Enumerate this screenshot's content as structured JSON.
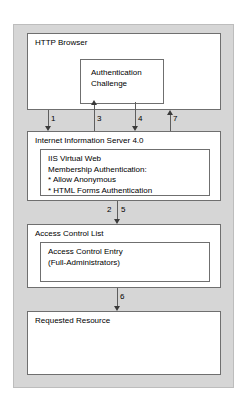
{
  "diagram": {
    "background_color": "#ffffff",
    "frame_color": "#d6d6d6",
    "box_border_color": "#6f6f6f",
    "arrow_color": "#3a3a3a"
  },
  "nodes": {
    "browser": {
      "label": "HTTP Browser",
      "inner": {
        "label": "Authentication\nChallenge"
      }
    },
    "iis": {
      "label": "Internet Information Server 4.0",
      "inner": {
        "label": "IIS Virtual Web\nMembership Authentication:\n* Allow Anonymous\n* HTML Forms Authentication"
      }
    },
    "acl": {
      "label": "Access Control List",
      "inner": {
        "label": "Access Control Entry\n(Full-Administrators)"
      }
    },
    "resource": {
      "label": "Requested Resource"
    }
  },
  "arrows": [
    {
      "id": "arrow-1",
      "label": "1",
      "direction": "down",
      "from": "browser",
      "to": "iis"
    },
    {
      "id": "arrow-3",
      "label": "3",
      "direction": "up",
      "from": "iis",
      "to": "auth-challenge"
    },
    {
      "id": "arrow-4",
      "label": "4",
      "direction": "down",
      "from": "auth-challenge",
      "to": "iis"
    },
    {
      "id": "arrow-7",
      "label": "7",
      "direction": "up",
      "from": "iis",
      "to": "browser"
    },
    {
      "id": "arrow-2-5",
      "label": "2",
      "label_secondary": "5",
      "direction": "down",
      "from": "iis",
      "to": "acl"
    },
    {
      "id": "arrow-6",
      "label": "6",
      "direction": "down",
      "from": "acl",
      "to": "resource"
    }
  ]
}
